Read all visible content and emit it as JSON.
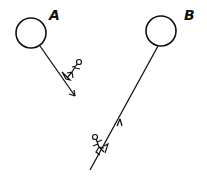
{
  "diagram": {
    "balloons": [
      {
        "label": "A",
        "cx": 31,
        "cy": 33,
        "r": 15
      },
      {
        "label": "B",
        "cx": 161,
        "cy": 31,
        "r": 15
      }
    ],
    "ropes": [
      {
        "from": "A",
        "x1": 40,
        "y1": 47,
        "x2": 74,
        "y2": 96,
        "arrow_direction": "down",
        "climber": "descending"
      },
      {
        "from": "B",
        "x1": 158,
        "y1": 46,
        "x2": 90,
        "y2": 170,
        "arrow_direction": "up",
        "climber": "ascending"
      }
    ],
    "stroke_color": "#111111",
    "background": "#ffffff"
  }
}
